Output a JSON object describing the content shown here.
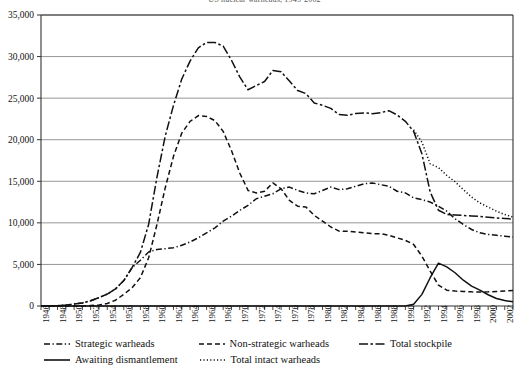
{
  "chart_data": {
    "type": "line",
    "title": "US nuclear warheads, 1945-2002",
    "xlabel": "",
    "ylabel": "",
    "xlim": [
      1945,
      2002
    ],
    "ylim": [
      0,
      35000
    ],
    "ytick_step": 5000,
    "grid": "horizontal",
    "legend_position": "below",
    "ytick_labels": [
      "0",
      "5,000",
      "10,000",
      "15,000",
      "20,000",
      "25,000",
      "30,000",
      "35,000"
    ],
    "ytick_values": [
      0,
      5000,
      10000,
      15000,
      20000,
      25000,
      30000,
      35000
    ],
    "xtick_labels": [
      "1946",
      "1948",
      "1950",
      "1952",
      "1954",
      "1956",
      "1958",
      "1960",
      "1962",
      "1964",
      "1966",
      "1968",
      "1970",
      "1972",
      "1974",
      "1976",
      "1978",
      "1980",
      "1982",
      "1984",
      "1986",
      "1988",
      "1990",
      "1992",
      "1994",
      "1996",
      "1998",
      "2000",
      "2002"
    ],
    "xtick_values": [
      1946,
      1948,
      1950,
      1952,
      1954,
      1956,
      1958,
      1960,
      1962,
      1964,
      1966,
      1968,
      1970,
      1972,
      1974,
      1976,
      1978,
      1980,
      1982,
      1984,
      1986,
      1988,
      1990,
      1992,
      1994,
      1996,
      1998,
      2000,
      2002
    ],
    "x": [
      1945,
      1946,
      1947,
      1948,
      1949,
      1950,
      1951,
      1952,
      1953,
      1954,
      1955,
      1956,
      1957,
      1958,
      1959,
      1960,
      1961,
      1962,
      1963,
      1964,
      1965,
      1966,
      1967,
      1968,
      1969,
      1970,
      1971,
      1972,
      1973,
      1974,
      1975,
      1976,
      1977,
      1978,
      1979,
      1980,
      1981,
      1982,
      1983,
      1984,
      1985,
      1986,
      1987,
      1988,
      1989,
      1990,
      1991,
      1992,
      1993,
      1994,
      1995,
      1996,
      1997,
      1998,
      1999,
      2000,
      2001,
      2002
    ],
    "series": [
      {
        "name": "Total stockpile",
        "style": "long-dash-dot",
        "color": "#111111",
        "values": [
          6,
          11,
          32,
          110,
          235,
          369,
          640,
          1005,
          1436,
          2063,
          3057,
          4618,
          6444,
          9822,
          15468,
          20434,
          24126,
          27297,
          29459,
          31056,
          31700,
          31700,
          31255,
          29561,
          27552,
          26008,
          26516,
          27000,
          28335,
          28170,
          27052,
          25914,
          25542,
          24418,
          24138,
          23764,
          23031,
          22937,
          23154,
          23228,
          23135,
          23254,
          23490,
          22981,
          22217,
          21004,
          18306,
          13708,
          11511,
          11011,
          10953,
          10886,
          10829,
          10779,
          10685,
          10577,
          10526,
          10457
        ],
        "note": "Peak 31,700 in 1966-67"
      },
      {
        "name": "Strategic warheads",
        "style": "dash-dot",
        "color": "#111111",
        "values": [
          6,
          11,
          32,
          110,
          235,
          369,
          640,
          1005,
          1436,
          2063,
          3057,
          4618,
          5500,
          6500,
          6800,
          6900,
          7000,
          7300,
          7700,
          8200,
          8800,
          9400,
          10200,
          10800,
          11500,
          12100,
          12900,
          13200,
          13500,
          14100,
          14300,
          13900,
          13600,
          13500,
          13900,
          14300,
          14000,
          14100,
          14400,
          14700,
          14800,
          14600,
          14400,
          13800,
          13600,
          13000,
          12800,
          12500,
          12000,
          11400,
          10500,
          9800,
          9200,
          8800,
          8600,
          8500,
          8400,
          8300
        ],
        "note": "Strategic warheads component"
      },
      {
        "name": "Non-strategic warheads",
        "style": "dash",
        "color": "#111111",
        "values": [
          0,
          0,
          0,
          0,
          0,
          0,
          50,
          120,
          300,
          700,
          1400,
          2200,
          3400,
          5800,
          9800,
          14200,
          18000,
          20800,
          22200,
          22900,
          22800,
          22300,
          21000,
          18700,
          16000,
          13900,
          13600,
          13800,
          14800,
          14100,
          12700,
          12000,
          11900,
          10900,
          10200,
          9500,
          9000,
          9000,
          8900,
          8800,
          8700,
          8700,
          8500,
          8200,
          7900,
          7400,
          6000,
          4200,
          2500,
          1900,
          1800,
          1750,
          1700,
          1680,
          1700,
          1750,
          1800,
          1850
        ],
        "note": "Peak ~23,000 in 1964"
      },
      {
        "name": "Awaiting dismantlement",
        "style": "solid",
        "color": "#111111",
        "values": [
          0,
          0,
          0,
          0,
          0,
          0,
          0,
          0,
          0,
          0,
          0,
          0,
          0,
          0,
          0,
          0,
          0,
          0,
          0,
          0,
          0,
          0,
          0,
          0,
          0,
          0,
          0,
          0,
          0,
          0,
          0,
          0,
          0,
          0,
          0,
          0,
          0,
          0,
          0,
          0,
          0,
          0,
          0,
          0,
          0,
          200,
          1400,
          3400,
          5150,
          4700,
          4000,
          3100,
          2400,
          1900,
          1350,
          900,
          650,
          500
        ],
        "note": "Peak ~5,150 in 1993"
      },
      {
        "name": "Total intact warheads",
        "style": "dotted",
        "color": "#111111",
        "values": [
          null,
          null,
          null,
          null,
          null,
          null,
          null,
          null,
          null,
          null,
          null,
          null,
          null,
          null,
          null,
          null,
          null,
          null,
          null,
          null,
          null,
          null,
          null,
          null,
          null,
          null,
          null,
          null,
          null,
          null,
          null,
          null,
          null,
          null,
          null,
          null,
          null,
          null,
          null,
          null,
          null,
          null,
          null,
          null,
          null,
          21200,
          19700,
          17100,
          16650,
          15700,
          14950,
          14000,
          13100,
          12400,
          11900,
          11400,
          11000,
          10700
        ],
        "note": "Stockpile plus warheads awaiting dismantlement"
      }
    ]
  },
  "legend": {
    "items": [
      {
        "label": "Strategic warheads",
        "style": "dash-dot"
      },
      {
        "label": "Non-strategic warheads",
        "style": "dash"
      },
      {
        "label": "Total stockpile",
        "style": "long-dash-dot"
      },
      {
        "label": "Awaiting dismantlement",
        "style": "solid"
      },
      {
        "label": "Total intact warheads",
        "style": "dotted"
      }
    ]
  }
}
